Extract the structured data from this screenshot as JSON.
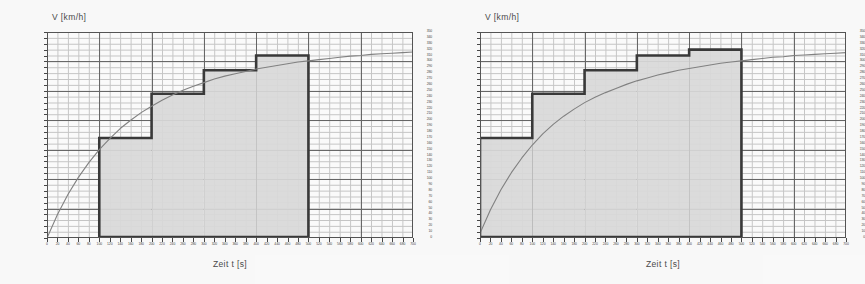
{
  "figure": {
    "background_color": "#fdfdfd",
    "panel_count": 2
  },
  "common": {
    "y_axis_title": "V [km/h]",
    "x_axis_title": "Zeit t [s]",
    "bar_fill_color": "#d8d8d8",
    "bar_edge_color": "#1a1a1a",
    "curve_color": "#6f6f6f",
    "grid_major_color": "#3a3a3a",
    "grid_minor_color": "#8d8d8d"
  },
  "y_ticks": [
    0,
    10,
    20,
    30,
    40,
    50,
    60,
    70,
    80,
    90,
    100,
    110,
    120,
    130,
    140,
    150,
    160,
    170,
    180,
    190,
    200,
    210,
    220,
    230,
    240,
    250,
    260,
    270,
    280,
    290,
    300,
    310,
    320,
    330,
    340,
    350
  ],
  "x_ticks": [
    0,
    20,
    40,
    60,
    80,
    100,
    120,
    140,
    160,
    180,
    200,
    220,
    240,
    260,
    280,
    300,
    320,
    340,
    360,
    380,
    400,
    420,
    440,
    460,
    480,
    500,
    520,
    540,
    560,
    580,
    600,
    620,
    640,
    660,
    680,
    700
  ],
  "chart_data": [
    {
      "type": "bar",
      "id": "left-chart",
      "title": "",
      "xlabel": "Zeit t [s]",
      "ylabel": "V [km/h]",
      "xlim": [
        0,
        700
      ],
      "ylim": [
        0,
        350
      ],
      "grid": true,
      "x_major_step": 100,
      "x_minor_step": 20,
      "y_major_step": 50,
      "y_minor_step": 10,
      "bar_edges": [
        100,
        200,
        300,
        400,
        500
      ],
      "bars": [
        {
          "x_start": 100,
          "x_end": 200,
          "value": 170
        },
        {
          "x_start": 200,
          "x_end": 300,
          "value": 245
        },
        {
          "x_start": 300,
          "x_end": 400,
          "value": 285
        },
        {
          "x_start": 400,
          "x_end": 500,
          "value": 310
        }
      ],
      "series": [
        {
          "name": "v(t)",
          "kind": "line",
          "x": [
            0,
            20,
            40,
            60,
            80,
            100,
            120,
            140,
            160,
            180,
            200,
            220,
            240,
            260,
            280,
            300,
            320,
            340,
            360,
            380,
            400,
            420,
            440,
            460,
            480,
            500,
            520,
            540,
            560,
            580,
            600,
            620,
            640,
            660,
            680,
            700
          ],
          "y": [
            0,
            40,
            74,
            103,
            128,
            150,
            169,
            186,
            200,
            213,
            224,
            234,
            243,
            251,
            258,
            264,
            270,
            275,
            279,
            283,
            287,
            290,
            293,
            296,
            299,
            301,
            303,
            305,
            307,
            309,
            310,
            312,
            313,
            314,
            315,
            316
          ]
        }
      ]
    },
    {
      "type": "bar",
      "id": "right-chart",
      "title": "",
      "xlabel": "Zeit t [s]",
      "ylabel": "V [km/h]",
      "xlim": [
        0,
        700
      ],
      "ylim": [
        0,
        350
      ],
      "grid": true,
      "x_major_step": 100,
      "x_minor_step": 20,
      "y_major_step": 50,
      "y_minor_step": 10,
      "bar_edges": [
        0,
        100,
        200,
        300,
        400,
        500
      ],
      "bars": [
        {
          "x_start": 0,
          "x_end": 100,
          "value": 170
        },
        {
          "x_start": 100,
          "x_end": 200,
          "value": 245
        },
        {
          "x_start": 200,
          "x_end": 300,
          "value": 285
        },
        {
          "x_start": 300,
          "x_end": 400,
          "value": 310
        },
        {
          "x_start": 400,
          "x_end": 500,
          "value": 320
        }
      ],
      "series": [
        {
          "name": "v(t)",
          "kind": "line",
          "x": [
            0,
            20,
            40,
            60,
            80,
            100,
            120,
            140,
            160,
            180,
            200,
            220,
            240,
            260,
            280,
            300,
            320,
            340,
            360,
            380,
            400,
            420,
            440,
            460,
            480,
            500,
            520,
            540,
            560,
            580,
            600,
            620,
            640,
            660,
            680,
            700
          ],
          "y": [
            8,
            48,
            82,
            111,
            136,
            158,
            177,
            193,
            207,
            219,
            230,
            239,
            247,
            254,
            261,
            267,
            272,
            277,
            281,
            285,
            288,
            291,
            294,
            297,
            299,
            301,
            303,
            305,
            307,
            308,
            310,
            311,
            312,
            313,
            314,
            315
          ]
        }
      ]
    }
  ]
}
